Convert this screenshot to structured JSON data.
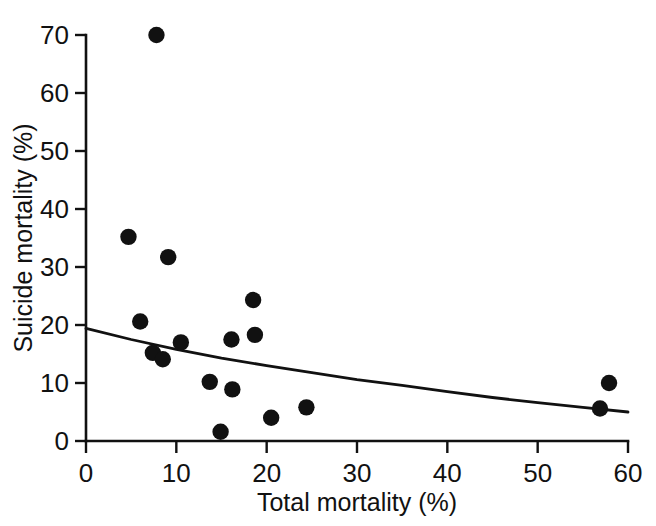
{
  "chart_data": {
    "type": "scatter",
    "title": "",
    "xlabel": "Total  mortality (%)",
    "ylabel": "Suicide mortality (%)",
    "xlim": [
      0,
      60
    ],
    "ylim": [
      0,
      70
    ],
    "xticks": [
      0,
      10,
      20,
      30,
      40,
      50,
      60
    ],
    "yticks": [
      0,
      10,
      20,
      30,
      40,
      50,
      60,
      70
    ],
    "xtick_labels": [
      "0",
      "10",
      "20",
      "30",
      "40",
      "50",
      "60"
    ],
    "ytick_labels": [
      "0",
      "10",
      "20",
      "30",
      "40",
      "50",
      "60",
      "70"
    ],
    "grid": false,
    "legend": null,
    "marker": "filled-circle",
    "marker_color": "#111111",
    "points": [
      {
        "x": 7.8,
        "y": 70.0
      },
      {
        "x": 4.7,
        "y": 35.2
      },
      {
        "x": 9.1,
        "y": 31.7
      },
      {
        "x": 18.5,
        "y": 24.3
      },
      {
        "x": 6.0,
        "y": 20.6
      },
      {
        "x": 18.7,
        "y": 18.3
      },
      {
        "x": 16.1,
        "y": 17.5
      },
      {
        "x": 10.5,
        "y": 17.0
      },
      {
        "x": 7.4,
        "y": 15.2
      },
      {
        "x": 8.5,
        "y": 14.1
      },
      {
        "x": 13.7,
        "y": 10.2
      },
      {
        "x": 57.9,
        "y": 10.0
      },
      {
        "x": 16.2,
        "y": 8.9
      },
      {
        "x": 24.4,
        "y": 5.8
      },
      {
        "x": 56.9,
        "y": 5.6
      },
      {
        "x": 20.5,
        "y": 4.0
      },
      {
        "x": 14.9,
        "y": 1.6
      }
    ],
    "fit_curve": {
      "name": "fitted-regression-curve",
      "style": "solid",
      "color": "#111111",
      "points": [
        {
          "x": 0.0,
          "y": 19.4
        },
        {
          "x": 5.0,
          "y": 17.5
        },
        {
          "x": 10.0,
          "y": 15.8
        },
        {
          "x": 15.0,
          "y": 14.3
        },
        {
          "x": 20.0,
          "y": 13.0
        },
        {
          "x": 25.0,
          "y": 11.8
        },
        {
          "x": 30.0,
          "y": 10.6
        },
        {
          "x": 35.0,
          "y": 9.6
        },
        {
          "x": 40.0,
          "y": 8.5
        },
        {
          "x": 45.0,
          "y": 7.5
        },
        {
          "x": 50.0,
          "y": 6.6
        },
        {
          "x": 55.0,
          "y": 5.8
        },
        {
          "x": 60.0,
          "y": 5.0
        }
      ]
    }
  },
  "axes": {
    "x_axis_name": "Total  mortality (%)",
    "y_axis_name": "Suicide mortality (%)"
  }
}
